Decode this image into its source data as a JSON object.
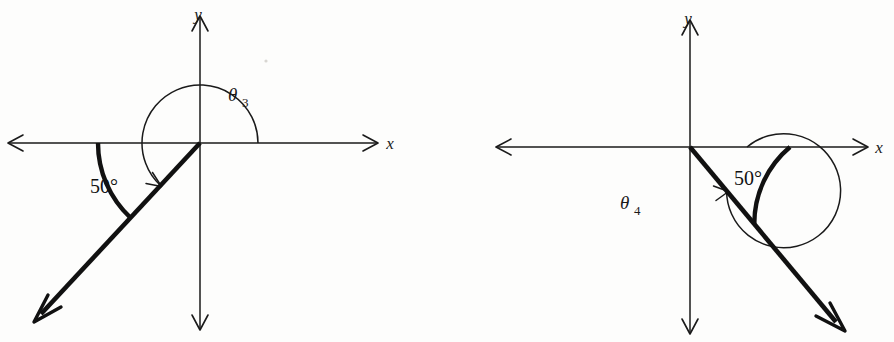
{
  "figure": {
    "background_color": "#fdfdfc",
    "ink_color": "#111111",
    "width": 894,
    "height": 342
  },
  "diagrams": [
    {
      "id": "diagram-left",
      "name": "theta-3-diagram",
      "origin": {
        "x": 200,
        "y": 143
      },
      "axes": {
        "x_label": "x",
        "y_label": "y",
        "x_label_pos": {
          "x": 390,
          "y": 148
        },
        "y_label_pos": {
          "x": 196,
          "y": 18
        },
        "x_start": {
          "x": 8,
          "y": 143
        },
        "x_end": {
          "x": 378,
          "y": 143
        },
        "y_start": {
          "x": 200,
          "y": 330
        },
        "y_end": {
          "x": 200,
          "y": 16
        }
      },
      "terminal_ray": {
        "name": "terminal-ray",
        "angle_deg": 227,
        "length": 245,
        "end": {
          "x": 33,
          "y": 322
        }
      },
      "reference_arc": {
        "name": "reference-angle-arc",
        "label": "50°",
        "label_pos": {
          "x": 104,
          "y": 186
        },
        "radius": 102,
        "start_deg": 180,
        "end_deg": 227,
        "style": "thick"
      },
      "rotation_arc": {
        "name": "rotation-angle-arc",
        "label": "θ",
        "subscript": "3",
        "label_pos": {
          "x": 228,
          "y": 96
        },
        "radius": 58,
        "start_deg": 0,
        "end_deg": 227,
        "direction": "counterclockwise",
        "style": "thin",
        "arrow_at_end": true
      },
      "angle_value_deg": 230
    },
    {
      "id": "diagram-right",
      "name": "theta-4-diagram",
      "origin": {
        "x": 690,
        "y": 147
      },
      "axes": {
        "x_label": "x",
        "y_label": "y",
        "x_label_pos": {
          "x": 879,
          "y": 152
        },
        "y_label_pos": {
          "x": 686,
          "y": 22
        },
        "x_start": {
          "x": 496,
          "y": 147
        },
        "x_end": {
          "x": 868,
          "y": 147
        },
        "y_start": {
          "x": 690,
          "y": 334
        },
        "y_end": {
          "x": 690,
          "y": 20
        }
      },
      "terminal_ray": {
        "name": "terminal-ray",
        "angle_deg": -50,
        "length": 240,
        "end": {
          "x": 844,
          "y": 331
        }
      },
      "reference_arc": {
        "name": "reference-angle-arc",
        "label": "50°",
        "label_pos": {
          "x": 745,
          "y": 178
        },
        "radius": 100,
        "start_deg": 0,
        "end_deg": -50,
        "style": "thick"
      },
      "rotation_arc": {
        "name": "rotation-angle-arc",
        "label": "θ",
        "subscript": "4",
        "label_pos": {
          "x": 620,
          "y": 206
        },
        "radius": 57,
        "start_deg": 0,
        "end_deg": -310,
        "direction": "clockwise-negative",
        "style": "thin",
        "arrow_at_end": true
      },
      "angle_value_deg": -310
    }
  ]
}
